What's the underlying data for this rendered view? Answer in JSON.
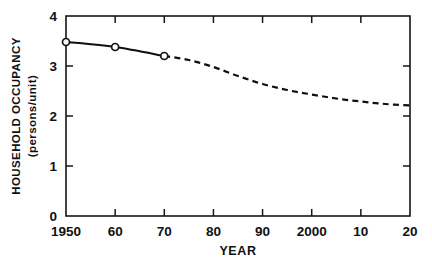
{
  "chart_data": {
    "type": "line",
    "title": "",
    "xlabel": "YEAR",
    "ylabel": "HOUSEHOLD OCCUPANCY (persons/unit)",
    "ylabel_line1": "HOUSEHOLD OCCUPANCY",
    "ylabel_line2": "(persons/unit)",
    "xlim": [
      1950,
      2020
    ],
    "ylim": [
      0,
      4
    ],
    "grid": false,
    "legend": null,
    "x_tick_labels": [
      "1950",
      "60",
      "70",
      "80",
      "90",
      "2000",
      "10",
      "20"
    ],
    "x_tick_values": [
      1950,
      1960,
      1970,
      1980,
      1990,
      2000,
      2010,
      2020
    ],
    "y_tick_labels": [
      "0",
      "1",
      "2",
      "3",
      "4"
    ],
    "y_tick_values": [
      0,
      1,
      2,
      3,
      4
    ],
    "series": [
      {
        "name": "Historical (observed)",
        "style": "solid",
        "marker": "open-circle",
        "x": [
          1950,
          1960,
          1970
        ],
        "values": [
          3.48,
          3.38,
          3.2
        ]
      },
      {
        "name": "Projected",
        "style": "dashed",
        "marker": "none",
        "x": [
          1970,
          1975,
          1980,
          1985,
          1990,
          1995,
          2000,
          2005,
          2010,
          2015,
          2020
        ],
        "values": [
          3.2,
          3.12,
          2.98,
          2.8,
          2.64,
          2.52,
          2.43,
          2.35,
          2.29,
          2.24,
          2.21
        ]
      }
    ],
    "colors": {
      "line": "#101014",
      "axis": "#16161a",
      "background": "#ffffff",
      "marker_fill": "#ffffff"
    }
  }
}
